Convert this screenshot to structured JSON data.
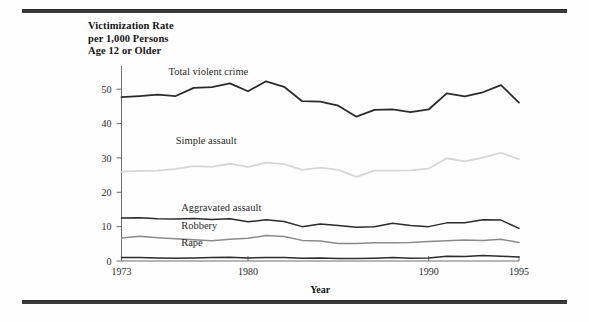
{
  "figure": {
    "title_lines": "Victimization Rate\nper 1,000 Persons\nAge 12 or Older",
    "xaxis_title": "Year"
  },
  "chart_data": {
    "type": "line",
    "title": "Victimization Rate per 1,000 Persons Age 12 or Older",
    "xlabel": "Year",
    "ylabel": "Victimization Rate per 1,000 Persons Age 12 or Older",
    "xlim": [
      1973,
      1995
    ],
    "ylim": [
      0,
      55
    ],
    "yticks": [
      0,
      10,
      20,
      30,
      40,
      50
    ],
    "xticks": [
      1973,
      1980,
      1990,
      1995
    ],
    "grid": false,
    "legend": "inline-labels",
    "x": [
      1973,
      1974,
      1975,
      1976,
      1977,
      1978,
      1979,
      1980,
      1981,
      1982,
      1983,
      1984,
      1985,
      1986,
      1987,
      1988,
      1989,
      1990,
      1991,
      1992,
      1993,
      1994,
      1995
    ],
    "series": [
      {
        "name": "Total violent crime",
        "color": "#2b2b2b",
        "width": 1.8,
        "label_x": 1975.6,
        "label_y": 54.0,
        "values": [
          47.7,
          48.0,
          48.4,
          48.0,
          50.4,
          50.6,
          51.7,
          49.4,
          52.3,
          50.7,
          46.5,
          46.4,
          45.2,
          42.0,
          44.0,
          44.1,
          43.3,
          44.1,
          48.8,
          47.9,
          49.1,
          51.2,
          46.1
        ]
      },
      {
        "name": "Simple assault",
        "color": "#d6d6d6",
        "width": 1.8,
        "label_x": 1976.0,
        "label_y": 34.0,
        "values": [
          26.0,
          26.2,
          26.3,
          26.8,
          27.6,
          27.4,
          28.3,
          27.4,
          28.6,
          28.2,
          26.5,
          27.2,
          26.5,
          24.5,
          26.3,
          26.3,
          26.4,
          26.9,
          29.9,
          29.0,
          30.1,
          31.5,
          29.6
        ]
      },
      {
        "name": "Aggravated assault",
        "color": "#2b2b2b",
        "width": 1.5,
        "label_x": 1976.3,
        "label_y": 14.6,
        "values": [
          12.5,
          12.6,
          12.3,
          12.2,
          12.4,
          12.1,
          12.3,
          11.4,
          12.0,
          11.5,
          10.0,
          10.8,
          10.3,
          9.8,
          10.0,
          11.0,
          10.3,
          10.0,
          11.1,
          11.1,
          12.0,
          11.9,
          9.5
        ]
      },
      {
        "name": "Robbery",
        "color": "#8a8a8a",
        "width": 1.5,
        "label_x": 1976.3,
        "label_y": 9.3,
        "values": [
          6.7,
          7.2,
          6.8,
          6.5,
          6.2,
          5.9,
          6.3,
          6.6,
          7.4,
          7.1,
          6.0,
          5.8,
          5.1,
          5.1,
          5.3,
          5.3,
          5.4,
          5.7,
          5.9,
          6.1,
          6.0,
          6.3,
          5.4
        ]
      },
      {
        "name": "Rape",
        "color": "#2b2b2b",
        "width": 1.5,
        "label_x": 1976.3,
        "label_y": 4.4,
        "values": [
          1.0,
          1.0,
          0.9,
          0.8,
          0.9,
          1.0,
          1.1,
          0.9,
          1.0,
          1.0,
          0.8,
          0.9,
          0.7,
          0.7,
          0.8,
          1.0,
          0.8,
          0.9,
          1.4,
          1.3,
          1.6,
          1.4,
          1.2
        ]
      }
    ]
  }
}
